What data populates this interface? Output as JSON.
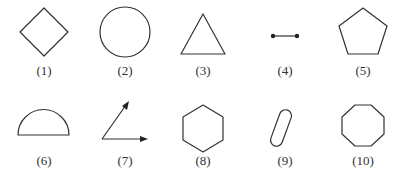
{
  "figures": [
    {
      "id": 1,
      "label": "(1)",
      "shape": "diamond"
    },
    {
      "id": 2,
      "label": "(2)",
      "shape": "circle"
    },
    {
      "id": 3,
      "label": "(3)",
      "shape": "triangle"
    },
    {
      "id": 4,
      "label": "(4)",
      "shape": "line-segment"
    },
    {
      "id": 5,
      "label": "(5)",
      "shape": "pentagon"
    },
    {
      "id": 6,
      "label": "(6)",
      "shape": "semicircle"
    },
    {
      "id": 7,
      "label": "(7)",
      "shape": "angle-rays"
    },
    {
      "id": 8,
      "label": "(8)",
      "shape": "hexagon"
    },
    {
      "id": 9,
      "label": "(9)",
      "shape": "capsule"
    },
    {
      "id": 10,
      "label": "(10)",
      "shape": "octagon"
    }
  ],
  "colors": {
    "stroke": "#333333",
    "background": "#ffffff"
  }
}
